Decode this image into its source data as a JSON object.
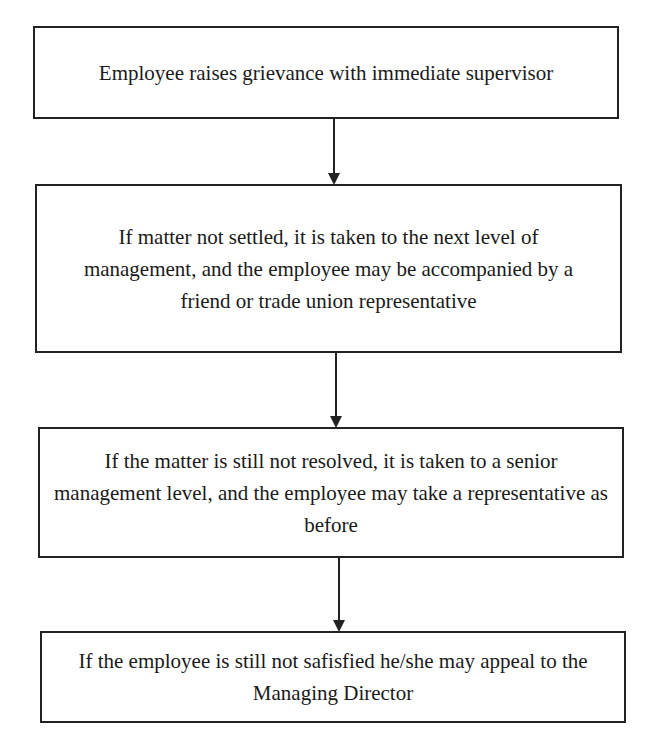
{
  "diagram": {
    "type": "flowchart",
    "steps": [
      {
        "text": "Employee raises grievance with immediate supervisor"
      },
      {
        "text": "If matter not settled, it is taken to the next level of management, and the employee may be accompanied by a friend or trade union representative"
      },
      {
        "text": "If the matter is still not resolved, it is taken to a senior management level, and the employee may take a representative as before"
      },
      {
        "text": "If the employee is still not safisfied he/she may appeal to the Managing Director"
      }
    ]
  }
}
